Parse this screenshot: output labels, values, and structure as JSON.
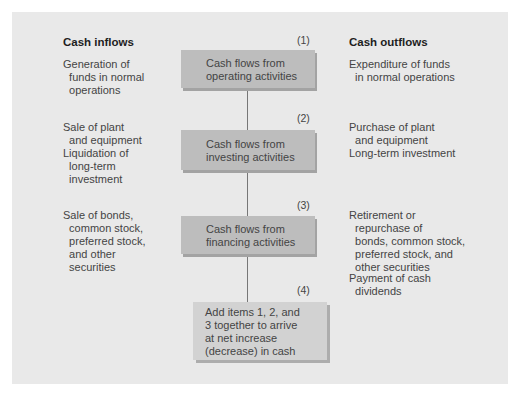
{
  "inflows": {
    "heading": "Cash inflows",
    "items": [
      "Generation of\n  funds in normal\n  operations",
      "Sale of plant\n  and equipment",
      "Liquidation of\n  long-term\n  investment",
      "Sale of bonds,\n  common stock,\n  preferred stock,\n  and other\n  securities"
    ]
  },
  "outflows": {
    "heading": "Cash outflows",
    "items": [
      "Expenditure of funds\n  in normal operations",
      "Purchase of plant\n  and equipment",
      "Long-term investment",
      "Retirement or\n  repurchase of\n  bonds, common stock,\n  preferred stock, and\n  other securities",
      "Payment of cash\n  dividends"
    ]
  },
  "flow": {
    "steps": [
      {
        "number": "(1)",
        "label": "Cash flows from\noperating activities"
      },
      {
        "number": "(2)",
        "label": "Cash flows from\ninvesting activities"
      },
      {
        "number": "(3)",
        "label": "Cash flows from\nfinancing activities"
      },
      {
        "number": "(4)",
        "label": "Add items 1, 2, and\n3 together to arrive\nat net increase\n(decrease) in cash"
      }
    ]
  },
  "colors": {
    "panel": "#e9e9e9",
    "box": "#bdbdbd",
    "result_box": "#d2d2d2",
    "connector": "#777777"
  }
}
